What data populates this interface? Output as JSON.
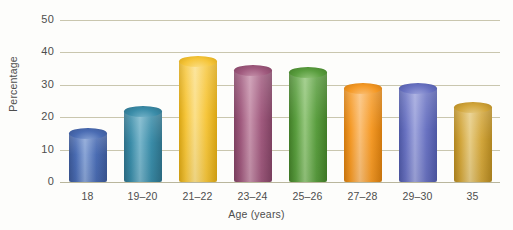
{
  "chart_data": {
    "type": "bar",
    "title": "",
    "xlabel": "Age (years)",
    "ylabel": "Percentage",
    "categories": [
      "18",
      "19–20",
      "21–22",
      "23–24",
      "25–26",
      "27–28",
      "29–30",
      "35"
    ],
    "values": [
      15,
      22,
      37.5,
      34.5,
      34,
      29,
      29,
      23
    ],
    "ylim": [
      0,
      50
    ],
    "ytick_labels": [
      "0",
      "10",
      "20",
      "30",
      "40",
      "50"
    ],
    "ytick_values": [
      0,
      10,
      20,
      30,
      40,
      50
    ],
    "grid": "horizontal",
    "legend": "none",
    "bar_colors": [
      "#4a6cb3",
      "#3a8ca8",
      "#f6c63c",
      "#a05a7e",
      "#5a9e3f",
      "#f59a27",
      "#6a73c2",
      "#d2a63c"
    ],
    "bar_colors_light": [
      "#8aa5d6",
      "#79b6cb",
      "#fbe08b",
      "#c894ad",
      "#96c87e",
      "#fbc179",
      "#a0a6dd",
      "#e7cd86"
    ],
    "bar_colors_dark": [
      "#3a5693",
      "#2d6f87",
      "#d9a513",
      "#7f4262",
      "#417d27",
      "#d27a0d",
      "#4d57a4",
      "#b0851f"
    ]
  },
  "axis": {
    "y_title": "Percentage",
    "x_title": "Age (years)"
  },
  "colors": {
    "gridline": "#c9c6ae",
    "text": "#4d4d4d",
    "background": "#fdfdfb"
  }
}
